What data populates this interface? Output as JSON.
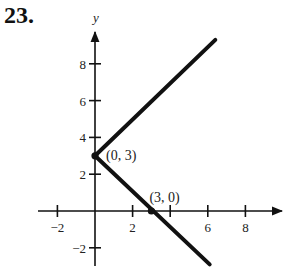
{
  "problem": {
    "number": "23."
  },
  "chart_data": {
    "type": "line",
    "title": "",
    "xlabel": "x",
    "ylabel": "y",
    "xlim": [
      -3,
      10
    ],
    "ylim": [
      -3,
      10
    ],
    "x_ticks": [
      -2,
      2,
      4,
      6,
      8
    ],
    "x_tick_labels": [
      "−2",
      "2",
      "",
      "6",
      "8"
    ],
    "y_ticks": [
      -2,
      2,
      4,
      6,
      8
    ],
    "y_tick_labels": [
      "−2",
      "2",
      "4",
      "6",
      "8"
    ],
    "grid": false,
    "series": [
      {
        "name": "upper ray",
        "x": [
          0,
          6.4
        ],
        "y": [
          3,
          9.3
        ]
      },
      {
        "name": "lower ray",
        "x": [
          0,
          6.1
        ],
        "y": [
          3,
          -2.9
        ]
      }
    ],
    "annotations": [
      {
        "text": "(0,  3)",
        "x": 0,
        "y": 3
      },
      {
        "text": "(3,  0)",
        "x": 3,
        "y": 0
      }
    ]
  }
}
